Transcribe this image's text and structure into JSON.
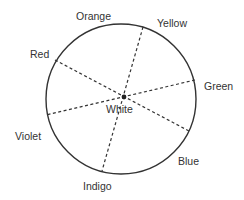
{
  "diagram": {
    "center_label": "White",
    "labels": {
      "orange": "Orange",
      "yellow": "Yellow",
      "red": "Red",
      "green": "Green",
      "violet": "Violet",
      "blue": "Blue",
      "indigo": "Indigo"
    },
    "colors": {
      "stroke": "#333333",
      "text": "#333333",
      "background": "#ffffff"
    }
  }
}
